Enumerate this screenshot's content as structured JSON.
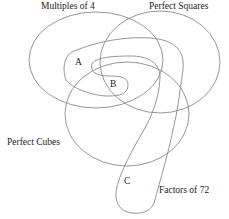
{
  "diagram": {
    "type": "venn",
    "sets": [
      {
        "id": "multiples-of-4",
        "label": "Multiples of 4"
      },
      {
        "id": "perfect-squares",
        "label": "Perfect Squares"
      },
      {
        "id": "perfect-cubes",
        "label": "Perfect Cubes"
      },
      {
        "id": "factors-of-72",
        "label": "Factors of 72"
      }
    ],
    "regions": [
      {
        "id": "A",
        "label": "A"
      },
      {
        "id": "B",
        "label": "B"
      },
      {
        "id": "C",
        "label": "C"
      }
    ],
    "stroke_color": "#888888"
  }
}
